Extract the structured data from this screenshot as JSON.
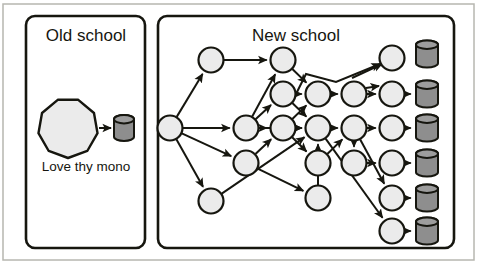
{
  "figure": {
    "canvas": {
      "width": 478,
      "height": 264
    },
    "background": "#ffffff",
    "outer_frame": {
      "x": 3,
      "y": 4,
      "width": 471,
      "height": 256,
      "stroke": "#b7b7b0",
      "stroke_width": 1.5
    },
    "colors": {
      "ink": "#16160f",
      "node_fill": "#ebebeb",
      "node_stroke": "#16160f",
      "store_fill": "#8e8e8e",
      "store_top_fill": "#9d9d9d",
      "store_stroke": "#16160f",
      "edge": "#16160f",
      "panel_stroke": "#16160f",
      "panel_fill": "#ffffff",
      "frame_stroke": "#b7b7b0"
    },
    "stroke_widths": {
      "panel": 2.6,
      "node": 2.2,
      "edge": 2.0,
      "store": 2.0
    }
  },
  "panels": [
    {
      "id": "old-school",
      "title": "Old school",
      "title_x": 86,
      "title_y": 41,
      "rect": {
        "x": 26,
        "y": 16,
        "width": 119,
        "height": 232,
        "rx": 9
      }
    },
    {
      "id": "new-school",
      "title": "New school",
      "title_x": 296,
      "title_y": 41,
      "rect": {
        "x": 158,
        "y": 16,
        "width": 296,
        "height": 232,
        "rx": 9
      }
    }
  ],
  "old_school": {
    "monolith": {
      "label": "monolith-octagon",
      "cx": 68,
      "cy": 128,
      "r": 30,
      "sides": 9
    },
    "datastore": {
      "label": "monolith-datastore",
      "cx": 124,
      "cy": 128,
      "width": 20,
      "height": 26
    },
    "edge": {
      "x1": 99,
      "y1": 128,
      "x2": 111,
      "y2": 128
    },
    "caption": {
      "text": "Love thy mono",
      "x": 86,
      "y": 171
    }
  },
  "new_school": {
    "nodes": [
      {
        "id": "n0",
        "cx": 170,
        "cy": 128,
        "r": 12.5
      },
      {
        "id": "n1",
        "cx": 211,
        "cy": 60,
        "r": 12.5
      },
      {
        "id": "n2",
        "cx": 211,
        "cy": 201,
        "r": 12.5
      },
      {
        "id": "n3",
        "cx": 246,
        "cy": 128,
        "r": 12.5
      },
      {
        "id": "n4",
        "cx": 246,
        "cy": 163,
        "r": 12.5
      },
      {
        "id": "n5",
        "cx": 283,
        "cy": 60,
        "r": 12.5
      },
      {
        "id": "n6",
        "cx": 283,
        "cy": 94,
        "r": 12.5
      },
      {
        "id": "n7",
        "cx": 283,
        "cy": 128,
        "r": 12.5
      },
      {
        "id": "n8",
        "cx": 318,
        "cy": 94,
        "r": 12.5
      },
      {
        "id": "n9",
        "cx": 318,
        "cy": 128,
        "r": 12.5
      },
      {
        "id": "n10",
        "cx": 318,
        "cy": 163,
        "r": 12.5
      },
      {
        "id": "n11",
        "cx": 318,
        "cy": 198,
        "r": 12.5
      },
      {
        "id": "n12",
        "cx": 354,
        "cy": 94,
        "r": 12.5
      },
      {
        "id": "n13",
        "cx": 354,
        "cy": 128,
        "r": 12.5
      },
      {
        "id": "n14",
        "cx": 354,
        "cy": 163,
        "r": 12.5
      },
      {
        "id": "n15",
        "cx": 392,
        "cy": 58,
        "r": 12.5
      },
      {
        "id": "n16",
        "cx": 392,
        "cy": 94,
        "r": 12.5
      },
      {
        "id": "n17",
        "cx": 392,
        "cy": 128,
        "r": 12.5
      },
      {
        "id": "n18",
        "cx": 392,
        "cy": 163,
        "r": 12.5
      },
      {
        "id": "n19",
        "cx": 392,
        "cy": 198,
        "r": 12.5
      },
      {
        "id": "n20",
        "cx": 392,
        "cy": 231,
        "r": 12.5
      }
    ],
    "datastores": [
      {
        "id": "d0",
        "cx": 427,
        "cy": 54,
        "width": 22,
        "height": 27
      },
      {
        "id": "d1",
        "cx": 427,
        "cy": 94,
        "width": 22,
        "height": 27
      },
      {
        "id": "d2",
        "cx": 427,
        "cy": 128,
        "width": 22,
        "height": 27
      },
      {
        "id": "d3",
        "cx": 427,
        "cy": 163,
        "width": 22,
        "height": 27
      },
      {
        "id": "d4",
        "cx": 427,
        "cy": 198,
        "width": 22,
        "height": 27
      },
      {
        "id": "d5",
        "cx": 427,
        "cy": 231,
        "width": 22,
        "height": 27
      }
    ],
    "edges": [
      {
        "from": "n0",
        "to": "n1"
      },
      {
        "from": "n0",
        "to": "n3"
      },
      {
        "from": "n0",
        "to": "n4"
      },
      {
        "from": "n0",
        "to": "n2"
      },
      {
        "from": "n1",
        "to": "n5"
      },
      {
        "from": "n3",
        "to": "n5"
      },
      {
        "from": "n3",
        "to": "n6"
      },
      {
        "from": "n3",
        "to": "n7"
      },
      {
        "from": "n3",
        "to": "n9"
      },
      {
        "from": "n5",
        "to": "n8"
      },
      {
        "from": "n6",
        "to": "n8"
      },
      {
        "from": "n6",
        "to": "n9"
      },
      {
        "from": "n7",
        "to": "n8"
      },
      {
        "from": "n7",
        "to": "n9"
      },
      {
        "from": "n8",
        "to": "n12"
      },
      {
        "from": "n9",
        "to": "n13"
      },
      {
        "from": "n4",
        "to": "n7"
      },
      {
        "from": "n2",
        "to": "n9"
      },
      {
        "from": "n7",
        "to": "n10"
      },
      {
        "from": "n11",
        "to": "n9"
      },
      {
        "from": "n4",
        "to": "n11"
      },
      {
        "from": "n12",
        "to": "n16"
      },
      {
        "from": "n13",
        "to": "n17"
      },
      {
        "from": "n13",
        "to": "n14"
      },
      {
        "from": "n14",
        "to": "n18"
      },
      {
        "from": "n16",
        "to": "d1"
      },
      {
        "from": "n17",
        "to": "d2"
      },
      {
        "from": "n18",
        "to": "d3"
      },
      {
        "from": "n19",
        "to": "d4"
      },
      {
        "from": "n20",
        "to": "d5"
      },
      {
        "from": "n10",
        "to": "n13"
      },
      {
        "from": "n9",
        "to": "n20"
      },
      {
        "from": "n13",
        "to": "n19"
      }
    ],
    "special_edges": [
      {
        "id": "tent-edge",
        "points": "296,94 306,74 336,82 380,64",
        "note": "bent edge rising above row then to top-right node"
      },
      {
        "id": "peak-to-n15",
        "x1": 352,
        "y1": 78,
        "x2": 382,
        "y2": 64
      },
      {
        "id": "n12-to-n16-up",
        "x1": 366,
        "y1": 88,
        "x2": 379,
        "y2": 86
      }
    ]
  }
}
